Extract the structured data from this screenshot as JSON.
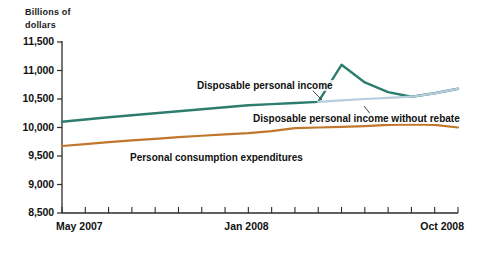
{
  "chart_data": {
    "type": "line",
    "title": "",
    "ylabel": "Billions of dollars",
    "ylabel_line1": "Billions of",
    "ylabel_line2": "dollars",
    "xlabel": "",
    "ylim": [
      8500,
      11500
    ],
    "yticks": [
      8500,
      9000,
      9500,
      10000,
      10500,
      11000,
      11500
    ],
    "ytick_labels": [
      "8,500",
      "9,000",
      "9,500",
      "10,000",
      "10,500",
      "11,000",
      "11,500"
    ],
    "grid": false,
    "legend_position": "inline-annotations",
    "x": [
      "May 2007",
      "Jun 2007",
      "Jul 2007",
      "Aug 2007",
      "Sep 2007",
      "Oct 2007",
      "Nov 2007",
      "Dec 2007",
      "Jan 2008",
      "Feb 2008",
      "Mar 2008",
      "Apr 2008",
      "May 2008",
      "Jun 2008",
      "Jul 2008",
      "Aug 2008",
      "Sep 2008",
      "Oct 2008"
    ],
    "xtick_labels": [
      "May 2007",
      "Jan 2008",
      "Oct 2008"
    ],
    "xtick_label_indices": [
      0,
      8,
      17
    ],
    "series": [
      {
        "name": "Disposable personal income",
        "color": "#2d7d6e",
        "values": [
          10100,
          10140,
          10180,
          10215,
          10250,
          10285,
          10320,
          10355,
          10390,
          10410,
          10430,
          10450,
          11100,
          10790,
          10620,
          10540,
          10600,
          10680
        ]
      },
      {
        "name": "Personal consumption expenditures",
        "color": "#c1762b",
        "values": [
          9675,
          9710,
          9745,
          9775,
          9800,
          9830,
          9855,
          9880,
          9900,
          9935,
          9990,
          10000,
          10010,
          10025,
          10045,
          10055,
          10045,
          10000
        ]
      },
      {
        "name": "Disposable personal income without rebate",
        "color": "#b8cde0",
        "values": [
          null,
          null,
          null,
          null,
          null,
          null,
          null,
          null,
          null,
          null,
          null,
          10450,
          10475,
          10500,
          10520,
          10540,
          10600,
          10680
        ]
      }
    ],
    "annotations": [
      {
        "text": "Disposable personal income",
        "series": "Disposable personal income"
      },
      {
        "text": "Disposable personal income without rebate",
        "series": "Disposable personal income without rebate"
      },
      {
        "text": "Personal consumption expenditures",
        "series": "Personal consumption expenditures"
      }
    ],
    "colors": {
      "disposable_personal_income": "#2d7d6e",
      "personal_consumption_expenditures": "#c1762b",
      "disposable_personal_income_without_rebate": "#b8cde0",
      "axis": "#2b2b2b",
      "text": "#111111",
      "background": "#ffffff"
    }
  }
}
